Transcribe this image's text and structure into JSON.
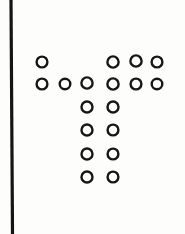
{
  "figure": {
    "kind": "dot-pattern-diagram",
    "background_color": "#fdfdfc",
    "ink_color": "#151515",
    "width": 185,
    "height": 234
  },
  "divider": {
    "name": "vertical-rule",
    "x_top": 11,
    "y_top": 0,
    "x_bottom": 12.5,
    "y_bottom": 234,
    "stroke_width": 3.2,
    "color": "#141414"
  },
  "marker_style": {
    "shape": "circle-outline",
    "radius": 5.4,
    "stroke_width": 2.4,
    "fill": "none",
    "stroke": "#161616"
  },
  "grid": {
    "column_x": [
      42,
      65,
      87,
      113,
      136,
      157
    ],
    "row_y": [
      62,
      84,
      107,
      130,
      154,
      177
    ]
  },
  "rows": [
    {
      "index": 1,
      "y": 62,
      "count": 4,
      "circles": [
        {
          "cx": 42,
          "cy": 62,
          "r": 5.4
        },
        {
          "cx": 113,
          "cy": 62,
          "r": 5.6
        },
        {
          "cx": 136,
          "cy": 61,
          "r": 5.6
        },
        {
          "cx": 157,
          "cy": 62,
          "r": 5.4
        }
      ]
    },
    {
      "index": 2,
      "y": 84,
      "count": 6,
      "circles": [
        {
          "cx": 42,
          "cy": 84,
          "r": 5.4
        },
        {
          "cx": 65,
          "cy": 84,
          "r": 5.3
        },
        {
          "cx": 87,
          "cy": 83,
          "r": 5.6
        },
        {
          "cx": 113,
          "cy": 84,
          "r": 5.6
        },
        {
          "cx": 136,
          "cy": 84,
          "r": 5.4
        },
        {
          "cx": 157,
          "cy": 84,
          "r": 5.3
        }
      ]
    },
    {
      "index": 3,
      "y": 107,
      "count": 2,
      "circles": [
        {
          "cx": 87,
          "cy": 107,
          "r": 5.5
        },
        {
          "cx": 113,
          "cy": 107,
          "r": 5.5
        }
      ]
    },
    {
      "index": 4,
      "y": 130,
      "count": 2,
      "circles": [
        {
          "cx": 87,
          "cy": 130,
          "r": 5.5
        },
        {
          "cx": 113,
          "cy": 130,
          "r": 5.4
        }
      ]
    },
    {
      "index": 5,
      "y": 154,
      "count": 2,
      "circles": [
        {
          "cx": 87,
          "cy": 154,
          "r": 5.5
        },
        {
          "cx": 113,
          "cy": 154,
          "r": 5.4
        }
      ]
    },
    {
      "index": 6,
      "y": 177,
      "count": 2,
      "circles": [
        {
          "cx": 87,
          "cy": 177,
          "r": 5.5
        },
        {
          "cx": 113,
          "cy": 177,
          "r": 5.4
        }
      ]
    }
  ],
  "totals": {
    "circle_count": 18
  }
}
